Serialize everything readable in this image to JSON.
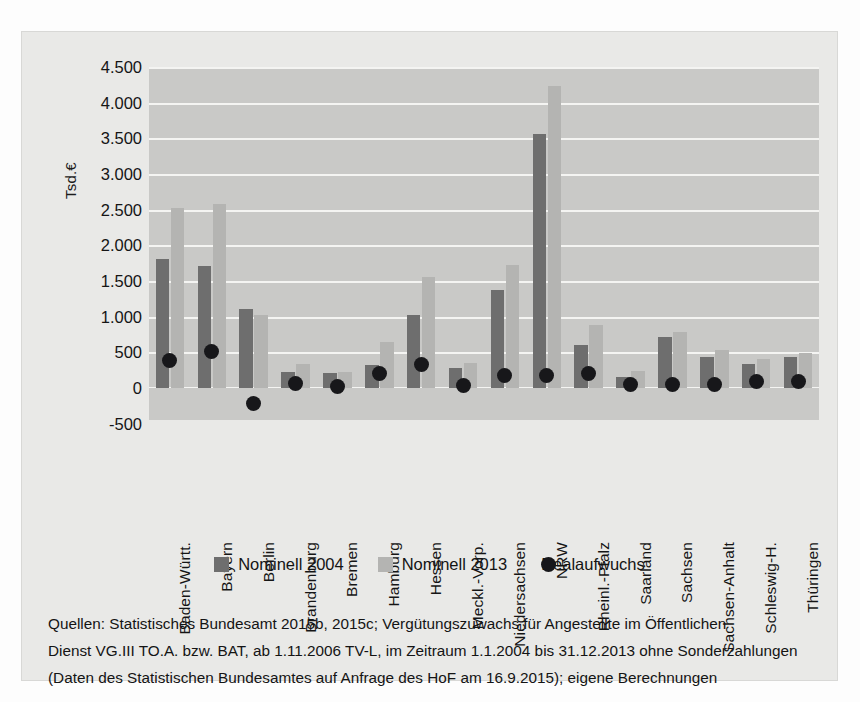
{
  "chart_data": {
    "type": "bar",
    "title": "",
    "xlabel": "",
    "ylabel": "Tsd.€",
    "ylim": [
      -500,
      4500
    ],
    "ytick_step": 500,
    "grid": true,
    "legend_position": "bottom",
    "yticks": [
      "4.500",
      "4.000",
      "3.500",
      "3.000",
      "2.500",
      "2.000",
      "1.500",
      "1.000",
      "500",
      "0",
      "-500"
    ],
    "categories": [
      "Baden-Württ.",
      "Bayern",
      "Berlin",
      "Brandenburg",
      "Bremen",
      "Hamburg",
      "Hessen",
      "Meckl.-Vorp.",
      "Niedersachsen",
      "NRW",
      "Rheinl.-Pfalz",
      "Saarland",
      "Sachsen",
      "Sachsen-Anhalt",
      "Schleswig-H.",
      "Thüringen"
    ],
    "series": [
      {
        "name": "Nominell 2004",
        "type": "bar",
        "color": "#6e6e6e",
        "values": [
          1810,
          1710,
          1110,
          230,
          205,
          320,
          1020,
          285,
          1380,
          3560,
          600,
          155,
          720,
          440,
          340,
          430
        ]
      },
      {
        "name": "Nominell 2013",
        "type": "bar",
        "color": "#b4b4b2",
        "values": [
          2520,
          2580,
          1030,
          340,
          225,
          640,
          1560,
          345,
          1730,
          4230,
          880,
          240,
          780,
          530,
          400,
          490
        ]
      },
      {
        "name": "Realaufwuchs",
        "type": "scatter",
        "color": "#17171a",
        "values": [
          380,
          510,
          -220,
          60,
          20,
          205,
          330,
          30,
          170,
          170,
          210,
          50,
          55,
          55,
          95,
          90
        ]
      }
    ]
  },
  "legend": {
    "items": [
      {
        "label": "Nominell 2004",
        "marker": "square-dark-swatch"
      },
      {
        "label": "Nominell 2013",
        "marker": "square-light-swatch"
      },
      {
        "label": "Realaufwuchs",
        "marker": "circle-dark-marker"
      }
    ]
  },
  "source": {
    "lines": [
      "Quellen: Statistisches Bundesamt 2015b, 2015c; Vergütungszuwachs für Angestellte im Öffentlichen",
      "Dienst VG.III TO.A. bzw. BAT, ab 1.11.2006 TV-L, im Zeitraum 1.1.2004 bis 31.12.2013 ohne Sonderzahlungen",
      "(Daten des Statistischen Bundesamtes auf Anfrage des HoF am 16.9.2015); eigene Berechnungen"
    ]
  },
  "colors": {
    "nominell_2004": "#6e6e6e",
    "nominell_2013": "#b4b4b2",
    "realaufwuchs": "#17171a",
    "plot_background": "#c9c9c7",
    "page_background": "#e9e9e7",
    "gridline": "#f4f4f2"
  }
}
